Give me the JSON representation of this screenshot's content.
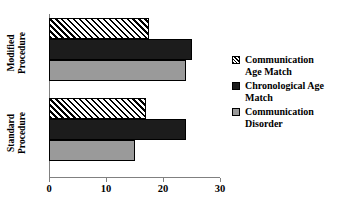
{
  "chart_data": {
    "type": "bar",
    "orientation": "horizontal",
    "title": "",
    "xlabel": "",
    "ylabel": "",
    "categories": [
      "Modified Procedure",
      "Standard Procedure"
    ],
    "category_lines": [
      [
        "Modified",
        "Procedure"
      ],
      [
        "Standard",
        "Procedure"
      ]
    ],
    "series": [
      {
        "name": "Communication Age Match",
        "name_lines": [
          "Communication",
          "Age Match"
        ],
        "fill": "hatched-diagonal",
        "color": "#000000",
        "values": [
          17.5,
          17.0
        ]
      },
      {
        "name": "Chronological Age Match",
        "name_lines": [
          "Chronological Age",
          "Match"
        ],
        "fill": "solid-black",
        "color": "#1c1c1c",
        "values": [
          25.0,
          24.0
        ]
      },
      {
        "name": "Communication Disorder",
        "name_lines": [
          "Communication",
          "Disorder"
        ],
        "fill": "solid-gray",
        "color": "#9a9a9a",
        "values": [
          24.0,
          15.0
        ]
      }
    ],
    "xlim": [
      0,
      30
    ],
    "xticks": [
      0,
      10,
      20,
      30
    ],
    "xtick_labels": [
      "0",
      "10",
      "20",
      "30"
    ],
    "grid": false,
    "legend_position": "right"
  },
  "legend": {
    "items": [
      {
        "line1": "Communication",
        "line2": "Age Match"
      },
      {
        "line1": "Chronological Age",
        "line2": "Match"
      },
      {
        "line1": "Communication",
        "line2": "Disorder"
      }
    ]
  },
  "axis": {
    "x_labels": [
      "0",
      "10",
      "20",
      "30"
    ]
  },
  "ycats": [
    {
      "line1": "Modified",
      "line2": "Procedure"
    },
    {
      "line1": "Standard",
      "line2": "Procedure"
    }
  ]
}
